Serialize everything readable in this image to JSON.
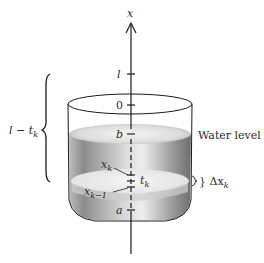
{
  "diagram": {
    "axis": {
      "label": "x"
    },
    "ticks": {
      "l": "l",
      "zero": "0",
      "b": "b",
      "a": "a"
    },
    "brace_label": {
      "main": "l − t",
      "sub": "k"
    },
    "water_level_label": "Water level",
    "slice": {
      "xk": {
        "main": "x",
        "sub": "k"
      },
      "tk": {
        "main": "t",
        "sub": "k"
      },
      "xk_minus_1": {
        "main": "x",
        "sub": "k−1"
      },
      "delta": {
        "main": "} Δx",
        "sub": "k"
      }
    },
    "colors": {
      "line": "#1a1a1a",
      "water_dark": "#7a7a7a",
      "water_light": "#e6e6e6",
      "background": "#ffffff"
    }
  }
}
